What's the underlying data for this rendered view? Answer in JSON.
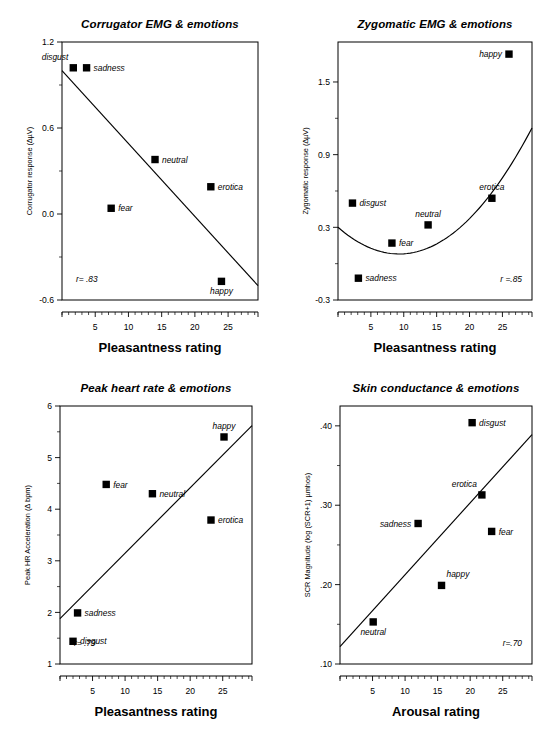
{
  "figure": {
    "panel_count": 4,
    "marker_color": "#000000",
    "line_color": "#000000",
    "background": "#ffffff"
  },
  "chart_data": [
    {
      "type": "scatter",
      "panel": "top-left",
      "title": "Corrugator EMG & emotions",
      "xlabel": "Pleasantness rating",
      "ylabel": "Corrugator response (∆µV)",
      "xlim": [
        0,
        29.5
      ],
      "ylim": [
        -0.6,
        1.2
      ],
      "xticks": [
        5,
        10,
        15,
        20,
        25
      ],
      "yticks": [
        -0.6,
        0.0,
        0.6,
        1.2
      ],
      "ytick_labels": [
        "-0.6",
        "0.0",
        "0.6",
        "1.2"
      ],
      "xtick_labels": [
        "5",
        "10",
        "15",
        "20",
        "25"
      ],
      "grid": false,
      "annotation": "r= .83",
      "points": [
        {
          "label": "disgust",
          "x": 1.7,
          "y": 1.02,
          "label_pos": "above-left"
        },
        {
          "label": "sadness",
          "x": 3.7,
          "y": 1.02,
          "label_pos": "right"
        },
        {
          "label": "neutral",
          "x": 14.0,
          "y": 0.38,
          "label_pos": "right"
        },
        {
          "label": "erotica",
          "x": 22.4,
          "y": 0.19,
          "label_pos": "right"
        },
        {
          "label": "fear",
          "x": 7.4,
          "y": 0.04,
          "label_pos": "right"
        },
        {
          "label": "happy",
          "x": 24.0,
          "y": -0.47,
          "label_pos": "below"
        }
      ],
      "fit": {
        "kind": "linear",
        "x0": 0.0,
        "y0": 1.0,
        "x1": 29.5,
        "y1": -0.5
      }
    },
    {
      "type": "scatter",
      "panel": "top-right",
      "title": "Zygomatic EMG & emotions",
      "xlabel": "Pleasantness rating",
      "ylabel": "Zygomatic response (∆µV)",
      "xlim": [
        0,
        29.5
      ],
      "ylim": [
        -0.3,
        1.83
      ],
      "xticks": [
        5,
        10,
        15,
        20,
        25
      ],
      "yticks": [
        -0.3,
        0.3,
        0.9,
        1.5
      ],
      "ytick_labels": [
        "-0.3",
        "0.3",
        "0.9",
        "1.5"
      ],
      "xtick_labels": [
        "5",
        "10",
        "15",
        "20",
        "25"
      ],
      "grid": false,
      "annotation": "r =.85",
      "points": [
        {
          "label": "happy",
          "x": 26.0,
          "y": 1.73,
          "label_pos": "left"
        },
        {
          "label": "erotica",
          "x": 23.4,
          "y": 0.54,
          "label_pos": "above"
        },
        {
          "label": "disgust",
          "x": 2.2,
          "y": 0.5,
          "label_pos": "right"
        },
        {
          "label": "neutral",
          "x": 13.7,
          "y": 0.32,
          "label_pos": "above"
        },
        {
          "label": "fear",
          "x": 8.2,
          "y": 0.17,
          "label_pos": "right"
        },
        {
          "label": "sadness",
          "x": 3.1,
          "y": -0.12,
          "label_pos": "right"
        }
      ],
      "fit": {
        "kind": "quadratic",
        "vertex_x": 9.3,
        "vertex_y": 0.08,
        "a": 0.00255
      }
    },
    {
      "type": "scatter",
      "panel": "bottom-left",
      "title": "Peak heart rate &  emotions",
      "xlabel": "Pleasantness rating",
      "ylabel": "Peak HR Acceleration (∆ bpm)",
      "xlim": [
        0,
        29.5
      ],
      "ylim": [
        1,
        6
      ],
      "xticks": [
        5,
        10,
        15,
        20,
        25
      ],
      "yticks": [
        1,
        2,
        3,
        4,
        5,
        6
      ],
      "ytick_labels": [
        "1",
        "2",
        "3",
        "4",
        "5",
        "6"
      ],
      "xtick_labels": [
        "5",
        "10",
        "15",
        "20",
        "25"
      ],
      "grid": false,
      "annotation": "r= .79",
      "points": [
        {
          "label": "happy",
          "x": 25.2,
          "y": 5.4,
          "label_pos": "above"
        },
        {
          "label": "fear",
          "x": 7.1,
          "y": 4.48,
          "label_pos": "right"
        },
        {
          "label": "neutral",
          "x": 14.2,
          "y": 4.3,
          "label_pos": "right"
        },
        {
          "label": "erotica",
          "x": 23.2,
          "y": 3.79,
          "label_pos": "right"
        },
        {
          "label": "sadness",
          "x": 2.7,
          "y": 1.99,
          "label_pos": "right"
        },
        {
          "label": "disgust",
          "x": 2.0,
          "y": 1.44,
          "label_pos": "right"
        }
      ],
      "fit": {
        "kind": "linear",
        "x0": 0.0,
        "y0": 1.88,
        "x1": 29.5,
        "y1": 5.62
      }
    },
    {
      "type": "scatter",
      "panel": "bottom-right",
      "title": "Skin conductance & emotions",
      "xlabel": "Arousal rating",
      "ylabel": "SCR Magnitude (log (SCR+1) µmhos)",
      "xlim": [
        0,
        29.5
      ],
      "ylim": [
        0.1,
        0.425
      ],
      "xticks": [
        5,
        10,
        15,
        20,
        25
      ],
      "yticks": [
        0.1,
        0.2,
        0.3,
        0.4
      ],
      "ytick_labels": [
        ".10",
        ".20",
        ".30",
        ".40"
      ],
      "xtick_labels": [
        "5",
        "10",
        "15",
        "20",
        "25"
      ],
      "grid": false,
      "annotation": "r=.70",
      "points": [
        {
          "label": "disgust",
          "x": 20.3,
          "y": 0.404,
          "label_pos": "right"
        },
        {
          "label": "erotica",
          "x": 21.8,
          "y": 0.313,
          "label_pos": "above-left"
        },
        {
          "label": "sadness",
          "x": 12.0,
          "y": 0.277,
          "label_pos": "left"
        },
        {
          "label": "fear",
          "x": 23.3,
          "y": 0.267,
          "label_pos": "right"
        },
        {
          "label": "happy",
          "x": 15.6,
          "y": 0.199,
          "label_pos": "above-right"
        },
        {
          "label": "neutral",
          "x": 5.1,
          "y": 0.153,
          "label_pos": "below"
        }
      ],
      "fit": {
        "kind": "linear",
        "x0": 0.0,
        "y0": 0.122,
        "x1": 29.5,
        "y1": 0.389
      }
    }
  ]
}
